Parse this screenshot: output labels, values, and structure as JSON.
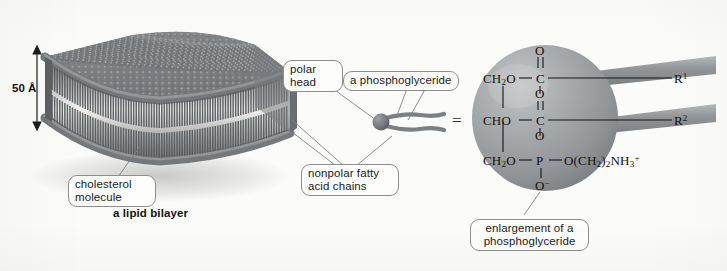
{
  "figure": {
    "background_color": "#fbfbf9"
  },
  "scale": {
    "value": "50 Å",
    "orientation": "vertical-double-arrow"
  },
  "bilayer": {
    "caption": "a lipid bilayer",
    "head_color": "#6f7275",
    "tail_color": "#5a5d60"
  },
  "callouts": {
    "polar_head": "polar\nhead",
    "cholesterol": "cholesterol\nmolecule",
    "nonpolar_tails": "nonpolar fatty\nacid chains",
    "phosphoglyceride": "a phosphoglyceride",
    "enlargement": "enlargement of a\nphosphoglyceride"
  },
  "equals_sign": "=",
  "molecule": {
    "sphere_color": "#9a9d9f",
    "rows": [
      {
        "backbone": "CH",
        "backbone_sub": "2",
        "backbone_tail": "O",
        "carbonyl_top": "O",
        "carbon": "C",
        "r_label": "R",
        "r_sup": "1"
      },
      {
        "backbone": "CHO",
        "carbonyl_top": "O",
        "carbon": "C",
        "r_label": "R",
        "r_sup": "2"
      },
      {
        "backbone": "CH",
        "backbone_sub": "2",
        "backbone_tail": "O",
        "phosphorus": "P",
        "head_group": "O(CH",
        "head_sub": "2",
        "head_mid": ")",
        "head_sub2": "2",
        "head_n": "NH",
        "head_sub3": "3",
        "head_charge": "+",
        "oxyanion": "O",
        "oxyanion_charge": "−"
      }
    ],
    "ester_oxygen_upper": "O",
    "ester_oxygen_lower": "O"
  }
}
